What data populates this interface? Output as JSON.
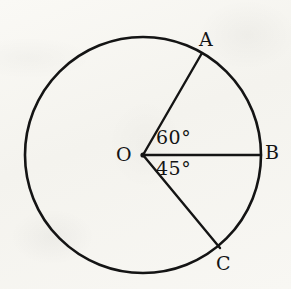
{
  "figure": {
    "type": "geometry-diagram",
    "background_color": "#f7f6f2",
    "stroke_color": "#141414",
    "circle": {
      "center": {
        "x": 143,
        "y": 155
      },
      "radius": 118,
      "stroke_width": 2.6
    },
    "points": [
      {
        "id": "O",
        "label": "O",
        "role": "center",
        "x": 143,
        "y": 155,
        "label_x": 116,
        "label_y": 145
      },
      {
        "id": "A",
        "label": "A",
        "role": "on-circle",
        "x": 202,
        "y": 53,
        "label_x": 199,
        "label_y": 30
      },
      {
        "id": "B",
        "label": "B",
        "role": "on-circle",
        "x": 261,
        "y": 155,
        "label_x": 265,
        "label_y": 143
      },
      {
        "id": "C",
        "label": "C",
        "role": "on-circle",
        "x": 220,
        "y": 248,
        "label_x": 216,
        "label_y": 254
      }
    ],
    "radii": [
      {
        "id": "OA",
        "from": "O",
        "to": "A",
        "angle_from_positive_x_axis_deg": 60,
        "stroke_width": 2.4
      },
      {
        "id": "OB",
        "from": "O",
        "to": "B",
        "angle_from_positive_x_axis_deg": 0,
        "stroke_width": 2.4
      },
      {
        "id": "OC",
        "from": "O",
        "to": "C",
        "angle_from_positive_x_axis_deg": -45,
        "stroke_width": 2.4
      }
    ],
    "angles": [
      {
        "id": "AOB",
        "label": "60°",
        "value": 60,
        "unit": "degrees",
        "between": [
          "OA",
          "OB"
        ],
        "label_x": 156,
        "label_y": 128
      },
      {
        "id": "BOC",
        "label": "45°",
        "value": 45,
        "unit": "degrees",
        "between": [
          "OB",
          "OC"
        ],
        "label_x": 156,
        "label_y": 159
      }
    ]
  }
}
